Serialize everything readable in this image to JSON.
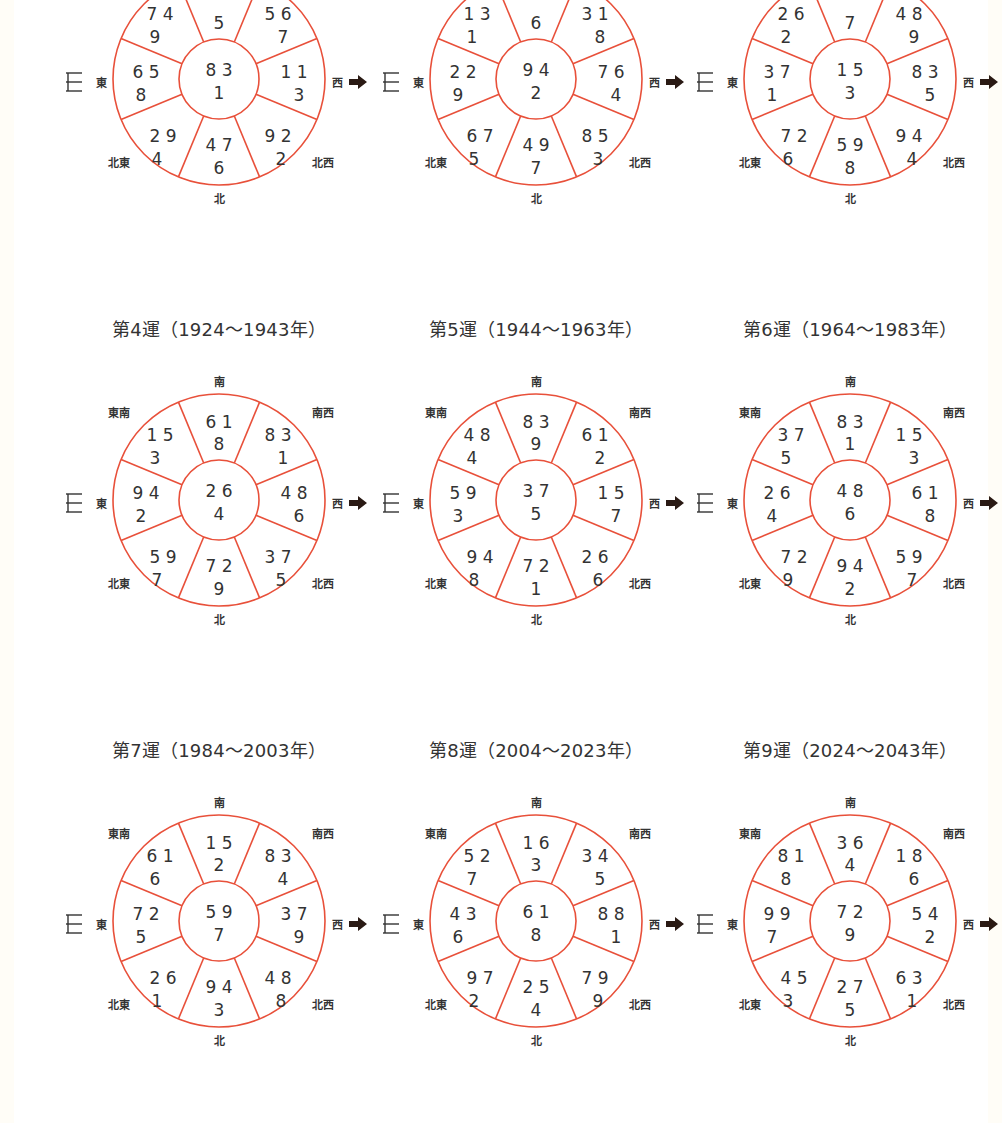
{
  "colors": {
    "ring": "#e8503a",
    "text": "#333333",
    "arrow": "#2a1a14",
    "background": "#ffffff",
    "margin": "#fffdf7"
  },
  "labels": {
    "south": "南",
    "southeast": "東南",
    "southwest": "南西",
    "east": "東",
    "west": "西",
    "northeast": "北東",
    "northwest": "北西",
    "north": "北"
  },
  "icons": {
    "door": "door-icon",
    "arrow": "arrow-right-icon"
  },
  "charts": [
    {
      "title": "",
      "cells": {
        "S": {
          "top": "",
          "bottom": "5"
        },
        "SE": {
          "top": "7 4",
          "bottom": "9"
        },
        "SW": {
          "top": "5 6",
          "bottom": "7"
        },
        "E": {
          "top": "6 5",
          "bottom": "8"
        },
        "C": {
          "top": "8 3",
          "bottom": "1"
        },
        "W": {
          "top": "1 1",
          "bottom": "3"
        },
        "NE": {
          "top": "2 9",
          "bottom": "4"
        },
        "N": {
          "top": "4 7",
          "bottom": "6"
        },
        "NW": {
          "top": "9 2",
          "bottom": "2"
        }
      }
    },
    {
      "title": "",
      "cells": {
        "S": {
          "top": "",
          "bottom": "6"
        },
        "SE": {
          "top": "1 3",
          "bottom": "1"
        },
        "SW": {
          "top": "3 1",
          "bottom": "8"
        },
        "E": {
          "top": "2 2",
          "bottom": "9"
        },
        "C": {
          "top": "9 4",
          "bottom": "2"
        },
        "W": {
          "top": "7 6",
          "bottom": "4"
        },
        "NE": {
          "top": "6 7",
          "bottom": "5"
        },
        "N": {
          "top": "4 9",
          "bottom": "7"
        },
        "NW": {
          "top": "8 5",
          "bottom": "3"
        }
      }
    },
    {
      "title": "",
      "cells": {
        "S": {
          "top": "",
          "bottom": "7"
        },
        "SE": {
          "top": "2 6",
          "bottom": "2"
        },
        "SW": {
          "top": "4 8",
          "bottom": "9"
        },
        "E": {
          "top": "3 7",
          "bottom": "1"
        },
        "C": {
          "top": "1 5",
          "bottom": "3"
        },
        "W": {
          "top": "8 3",
          "bottom": "5"
        },
        "NE": {
          "top": "7 2",
          "bottom": "6"
        },
        "N": {
          "top": "5 9",
          "bottom": "8"
        },
        "NW": {
          "top": "9 4",
          "bottom": "4"
        }
      }
    },
    {
      "title": "第4運（1924～1943年）",
      "cells": {
        "S": {
          "top": "6 1",
          "bottom": "8"
        },
        "SE": {
          "top": "1 5",
          "bottom": "3"
        },
        "SW": {
          "top": "8 3",
          "bottom": "1"
        },
        "E": {
          "top": "9 4",
          "bottom": "2"
        },
        "C": {
          "top": "2 6",
          "bottom": "4"
        },
        "W": {
          "top": "4 8",
          "bottom": "6"
        },
        "NE": {
          "top": "5 9",
          "bottom": "7"
        },
        "N": {
          "top": "7 2",
          "bottom": "9"
        },
        "NW": {
          "top": "3 7",
          "bottom": "5"
        }
      }
    },
    {
      "title": "第5運（1944～1963年）",
      "cells": {
        "S": {
          "top": "8 3",
          "bottom": "9"
        },
        "SE": {
          "top": "4 8",
          "bottom": "4"
        },
        "SW": {
          "top": "6 1",
          "bottom": "2"
        },
        "E": {
          "top": "5 9",
          "bottom": "3"
        },
        "C": {
          "top": "3 7",
          "bottom": "5"
        },
        "W": {
          "top": "1 5",
          "bottom": "7"
        },
        "NE": {
          "top": "9 4",
          "bottom": "8"
        },
        "N": {
          "top": "7 2",
          "bottom": "1"
        },
        "NW": {
          "top": "2 6",
          "bottom": "6"
        }
      }
    },
    {
      "title": "第6運（1964～1983年）",
      "cells": {
        "S": {
          "top": "8 3",
          "bottom": "1"
        },
        "SE": {
          "top": "3 7",
          "bottom": "5"
        },
        "SW": {
          "top": "1 5",
          "bottom": "3"
        },
        "E": {
          "top": "2 6",
          "bottom": "4"
        },
        "C": {
          "top": "4 8",
          "bottom": "6"
        },
        "W": {
          "top": "6 1",
          "bottom": "8"
        },
        "NE": {
          "top": "7 2",
          "bottom": "9"
        },
        "N": {
          "top": "9 4",
          "bottom": "2"
        },
        "NW": {
          "top": "5 9",
          "bottom": "7"
        }
      }
    },
    {
      "title": "第7運（1984～2003年）",
      "cells": {
        "S": {
          "top": "1 5",
          "bottom": "2"
        },
        "SE": {
          "top": "6 1",
          "bottom": "6"
        },
        "SW": {
          "top": "8 3",
          "bottom": "4"
        },
        "E": {
          "top": "7 2",
          "bottom": "5"
        },
        "C": {
          "top": "5 9",
          "bottom": "7"
        },
        "W": {
          "top": "3 7",
          "bottom": "9"
        },
        "NE": {
          "top": "2 6",
          "bottom": "1"
        },
        "N": {
          "top": "9 4",
          "bottom": "3"
        },
        "NW": {
          "top": "4 8",
          "bottom": "8"
        }
      }
    },
    {
      "title": "第8運（2004～2023年）",
      "cells": {
        "S": {
          "top": "1 6",
          "bottom": "3"
        },
        "SE": {
          "top": "5 2",
          "bottom": "7"
        },
        "SW": {
          "top": "3 4",
          "bottom": "5"
        },
        "E": {
          "top": "4 3",
          "bottom": "6"
        },
        "C": {
          "top": "6 1",
          "bottom": "8"
        },
        "W": {
          "top": "8 8",
          "bottom": "1"
        },
        "NE": {
          "top": "9 7",
          "bottom": "2"
        },
        "N": {
          "top": "2 5",
          "bottom": "4"
        },
        "NW": {
          "top": "7 9",
          "bottom": "9"
        }
      }
    },
    {
      "title": "第9運（2024～2043年）",
      "cells": {
        "S": {
          "top": "3 6",
          "bottom": "4"
        },
        "SE": {
          "top": "8 1",
          "bottom": "8"
        },
        "SW": {
          "top": "1 8",
          "bottom": "6"
        },
        "E": {
          "top": "9 9",
          "bottom": "7"
        },
        "C": {
          "top": "7 2",
          "bottom": "9"
        },
        "W": {
          "top": "5 4",
          "bottom": "2"
        },
        "NE": {
          "top": "4 5",
          "bottom": "3"
        },
        "N": {
          "top": "2 7",
          "bottom": "5"
        },
        "NW": {
          "top": "6 3",
          "bottom": "1"
        }
      }
    }
  ]
}
